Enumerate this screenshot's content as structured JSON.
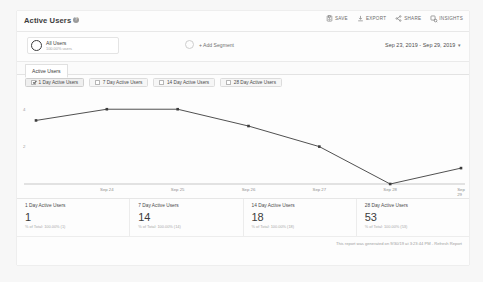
{
  "header": {
    "title": "Active Users",
    "help_icon": "question-mark-icon",
    "toolbar": [
      {
        "label": "SAVE",
        "icon": "save-icon"
      },
      {
        "label": "EXPORT",
        "icon": "download-icon"
      },
      {
        "label": "SHARE",
        "icon": "share-icon"
      },
      {
        "label": "INSIGHTS",
        "icon": "insights-icon"
      }
    ]
  },
  "segments": {
    "primary": {
      "name": "All Users",
      "detail": "100.00% users"
    },
    "add_label": "+ Add Segment",
    "date_range": "Sep 23, 2019 - Sep 29, 2019",
    "date_caret": "▾"
  },
  "tabs": [
    {
      "label": "Active Users",
      "active": true
    }
  ],
  "metric_chips": [
    {
      "label": "1 Day Active Users",
      "checked": true
    },
    {
      "label": "7 Day Active Users",
      "checked": false
    },
    {
      "label": "14 Day Active Users",
      "checked": false
    },
    {
      "label": "28 Day Active Users",
      "checked": false
    }
  ],
  "summary_cards": [
    {
      "title": "1 Day Active Users",
      "value": "1",
      "sub": "% of Total: 100.00% (1)"
    },
    {
      "title": "7 Day Active Users",
      "value": "14",
      "sub": "% of Total: 100.00% (14)"
    },
    {
      "title": "14 Day Active Users",
      "value": "18",
      "sub": "% of Total: 100.00% (18)"
    },
    {
      "title": "28 Day Active Users",
      "value": "53",
      "sub": "% of Total: 100.00% (53)"
    }
  ],
  "footer": {
    "generated_text": "This report was generated on 9/30/19 at 3:23:44 PM - ",
    "refresh_label": "Refresh Report"
  },
  "chart_data": {
    "type": "line",
    "title": "Active Users",
    "series": [
      {
        "name": "1 Day Active Users",
        "values": [
          3.4,
          4,
          4,
          3.1,
          2.0,
          0,
          0.85
        ],
        "color": "#3c3c3c"
      }
    ],
    "x": [
      "Sep 23",
      "Sep 24",
      "Sep 25",
      "Sep 26",
      "Sep 27",
      "Sep 28",
      "Sep 29"
    ],
    "tick_labels": [
      "Sep 24",
      "Sep 25",
      "Sep 26",
      "Sep 27",
      "Sep 28",
      "Sep 29"
    ],
    "yticks": [
      2,
      4
    ],
    "ylim": [
      0,
      4.6
    ],
    "xlabel": "",
    "ylabel": "",
    "grid": false,
    "legend": "none",
    "marker": "square"
  }
}
